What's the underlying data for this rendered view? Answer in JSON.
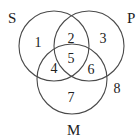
{
  "diagram": {
    "type": "venn-3",
    "stroke_color": "#4a4a4a",
    "text_color": "#222222",
    "sets": [
      {
        "id": "S",
        "label": "S",
        "cx": 54,
        "cy": 46,
        "r": 35,
        "label_x": 8,
        "label_y": 23
      },
      {
        "id": "P",
        "label": "P",
        "cx": 89,
        "cy": 46,
        "r": 35,
        "label_x": 127,
        "label_y": 23
      },
      {
        "id": "M",
        "label": "M",
        "cx": 72,
        "cy": 79,
        "r": 35,
        "label_x": 67,
        "label_y": 135
      }
    ],
    "regions": [
      {
        "label": "1",
        "description": "S only",
        "x": 38,
        "y": 47
      },
      {
        "label": "2",
        "description": "S and P only",
        "x": 71,
        "y": 43
      },
      {
        "label": "3",
        "description": "P only",
        "x": 103,
        "y": 43
      },
      {
        "label": "4",
        "description": "S and M only",
        "x": 54,
        "y": 73
      },
      {
        "label": "5",
        "description": "S, P and M",
        "x": 71,
        "y": 63
      },
      {
        "label": "6",
        "description": "P and M only",
        "x": 91,
        "y": 74
      },
      {
        "label": "7",
        "description": "M only",
        "x": 71,
        "y": 102
      },
      {
        "label": "8",
        "description": "outside all sets",
        "x": 117,
        "y": 93
      }
    ]
  }
}
